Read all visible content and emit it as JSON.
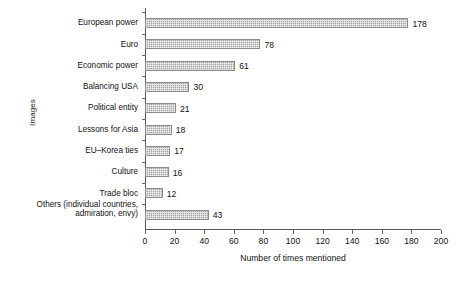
{
  "chart_data": {
    "type": "bar",
    "orientation": "horizontal",
    "title": "",
    "xlabel": "Number of times mentioned",
    "ylabel": "Images",
    "xlim": [
      0,
      200
    ],
    "xticks": [
      0,
      20,
      40,
      60,
      80,
      100,
      120,
      140,
      160,
      180,
      200
    ],
    "grid": false,
    "legend": null,
    "categories": [
      "European power",
      "Euro",
      "Economic power",
      "Balancing USA",
      "Political entity",
      "Lessons for Asia",
      "EU–Korea ties",
      "Culture",
      "Trade bloc",
      "Others (individual countries, admiration, envy)"
    ],
    "values": [
      178,
      78,
      61,
      30,
      21,
      18,
      17,
      16,
      12,
      43
    ],
    "data_labels": [
      "178",
      "78",
      "61",
      "30",
      "21",
      "18",
      "17",
      "16",
      "12",
      "43"
    ],
    "bar_color": "#b4b4b4",
    "bar_border_color": "#8c8c8c",
    "axis_color": "#595959"
  },
  "axes": {
    "y_title": "Images",
    "x_title": "Number of times mentioned",
    "x_tick_labels": [
      "0",
      "20",
      "40",
      "60",
      "80",
      "100",
      "120",
      "140",
      "160",
      "180",
      "200"
    ],
    "category_labels": [
      "European power",
      "Euro",
      "Economic power",
      "Balancing USA",
      "Political entity",
      "Lessons for Asia",
      "EU–Korea ties",
      "Culture",
      "Trade bloc"
    ],
    "category_label_last_line1": "Others (individual countries,",
    "category_label_last_line2": "admiration, envy)"
  }
}
